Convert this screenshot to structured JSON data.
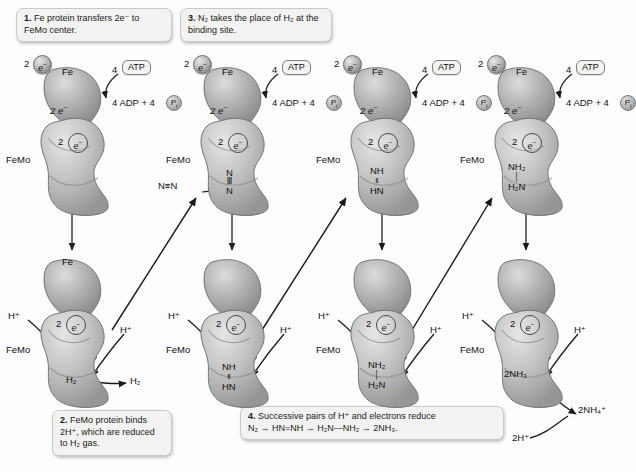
{
  "figure": {
    "background": "#fdfdfd",
    "protein_fill": "#b9b9b9"
  },
  "captions": [
    {
      "id": "caption-1",
      "number": "1.",
      "text": "Fe protein transfers 2e⁻ to FeMo center."
    },
    {
      "id": "caption-3",
      "number": "3.",
      "text": "N₂ takes the place of H₂ at the binding site."
    },
    {
      "id": "caption-2",
      "number": "2.",
      "text": "FeMo protein binds 2H⁺, which are reduced to H₂ gas."
    },
    {
      "id": "caption-4",
      "number": "4.",
      "line1": "Successive pairs of H⁺ and electrons reduce",
      "line2": "N₂ → HN=NH → H₂N—NH₂ → 2NH₃."
    }
  ],
  "labels": {
    "fe": "Fe",
    "femo": "FeMo",
    "two_e_in": "2",
    "e_minus": "e⁻",
    "atp": "4",
    "atp_box": "ATP",
    "adp": "4 ADP + 4",
    "pi": "P",
    "pi_sub": "i",
    "h_plus": "H⁺"
  },
  "top_row": [
    {
      "name": "top-protein-1",
      "substrate_lines": [],
      "incoming": ""
    },
    {
      "name": "top-protein-2",
      "substrate_lines": [
        "N",
        "Ⅲ",
        "N"
      ],
      "incoming": "N≡N"
    },
    {
      "name": "top-protein-3",
      "substrate_lines": [
        "NH",
        "‖",
        "HN"
      ],
      "incoming": ""
    },
    {
      "name": "top-protein-4",
      "substrate_lines": [
        "NH₂",
        "│",
        "H₂N"
      ],
      "incoming": ""
    }
  ],
  "bottom_row": [
    {
      "name": "bottom-protein-1",
      "product": "H₂",
      "release": "H₂",
      "extra": ""
    },
    {
      "name": "bottom-protein-2",
      "product_lines": [
        "NH",
        "‖",
        "HN"
      ],
      "release": "",
      "extra": ""
    },
    {
      "name": "bottom-protein-3",
      "product_lines": [
        "NH₂",
        "│",
        "H₂N"
      ],
      "release": "",
      "extra": ""
    },
    {
      "name": "bottom-protein-4",
      "product": "2NH₃",
      "release": "2NH₄⁺",
      "extra": "2H⁺"
    }
  ],
  "columns": [
    {
      "index": 1,
      "x": 18
    },
    {
      "index": 2,
      "x": 178
    },
    {
      "index": 3,
      "x": 328
    },
    {
      "index": 4,
      "x": 472
    }
  ]
}
